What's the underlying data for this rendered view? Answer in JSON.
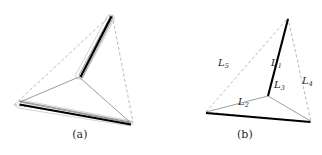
{
  "figure": {
    "subfigures": [
      {
        "id": "a",
        "caption": "(a)",
        "description": "dashed-triangle-with-steiner-tree-and-thick-segments-outlined"
      },
      {
        "id": "b",
        "caption": "(b)",
        "description": "dashed-triangle-with-labelled-steiner-tree"
      }
    ],
    "labels": [
      {
        "id": "L1",
        "base": "L",
        "sub": "1"
      },
      {
        "id": "L2",
        "base": "L",
        "sub": "2"
      },
      {
        "id": "L3",
        "base": "L",
        "sub": "3"
      },
      {
        "id": "L4",
        "base": "L",
        "sub": "4"
      },
      {
        "id": "L5",
        "base": "L",
        "sub": "5"
      }
    ],
    "colors": {
      "thick_line": "#000000",
      "thin_line": "#7a7a7a",
      "dashed_line": "#9a9a9a",
      "outline": "#b0b0b0",
      "background": "#ffffff",
      "text": "#232323"
    }
  }
}
